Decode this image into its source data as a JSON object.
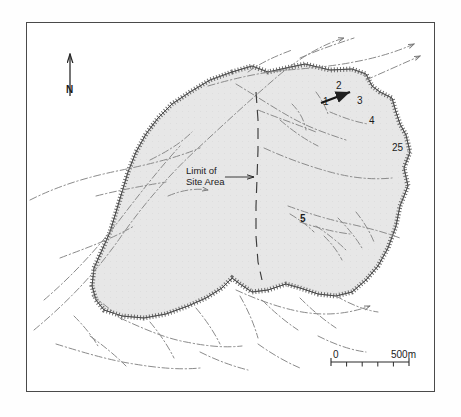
{
  "figure": {
    "kind": "site-location-map",
    "frame": {
      "x": 26,
      "y": 22,
      "width": 409,
      "height": 370
    }
  },
  "north_arrow": {
    "label": "N",
    "icon": "north-arrow-icon",
    "x": 70,
    "y": 52,
    "length": 38
  },
  "annotation": {
    "limit_line1": "Limit of",
    "limit_line2": "Site Area",
    "leader_from": [
      243,
      177
    ],
    "leader_to": [
      258,
      177
    ]
  },
  "site_area": {
    "name": "site-area-polygon",
    "fill": "#e7e7e7",
    "stroke": "#8d8d8d",
    "tick_stroke": "#6f6f6f",
    "points": "232,72 252,66 268,72 286,68 305,64 330,70 352,69 366,74 372,86 380,92 392,98 396,112 400,124 406,135 410,152 404,168 408,186 400,206 396,226 388,248 378,266 366,280 352,292 336,296 318,294 300,288 286,284 268,290 252,292 240,284 232,278 222,288 206,298 188,306 166,314 144,318 122,316 104,310 96,300 92,286 94,268 102,250 110,232 116,212 122,192 128,172 136,152 146,134 158,118 172,104 190,92 210,80"
  },
  "site_label_points": [
    {
      "id": "num-1",
      "text": "1"
    },
    {
      "id": "num-2",
      "text": "2"
    },
    {
      "id": "num-3",
      "text": "3"
    },
    {
      "id": "num-4",
      "text": "4"
    },
    {
      "id": "num-25",
      "text": "25"
    },
    {
      "id": "num-5",
      "text": "5"
    }
  ],
  "pointer_arrow": {
    "name": "site-feature-arrow",
    "from": [
      321,
      103
    ],
    "to": [
      352,
      92
    ]
  },
  "centre_dashed_line": {
    "name": "site-limit-dashed-line",
    "points": "256,92 258,120 258,150 257,178 256,206 256,236 258,262 262,280"
  },
  "scale_bar": {
    "zero_label": "0",
    "max_label": "500m",
    "x": 331,
    "y": 362,
    "width": 78,
    "divisions": 5
  },
  "chart_data": {
    "type": "map",
    "title": "",
    "legend": [
      "Limit of Site Area"
    ],
    "scale": {
      "from": 0,
      "to": 500,
      "unit": "m",
      "divisions": 5
    },
    "orientation": "north-up",
    "annotations": [
      "1",
      "2",
      "3",
      "4",
      "25",
      "5",
      "Limit of",
      "Site Area",
      "N",
      "0",
      "500m"
    ]
  }
}
